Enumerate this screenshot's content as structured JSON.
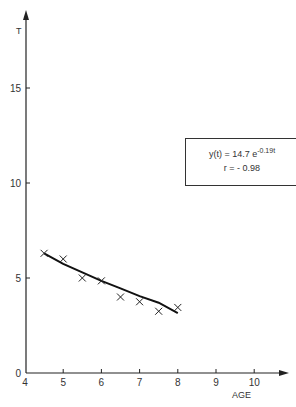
{
  "chart_data": {
    "type": "scatter",
    "title": "",
    "xlabel": "AGE",
    "ylabel": "T",
    "xlim": [
      4,
      10.8
    ],
    "ylim": [
      0,
      19
    ],
    "x_ticks": [
      "4",
      "5",
      "6",
      "7",
      "8",
      "9",
      "10"
    ],
    "y_ticks": [
      "0",
      "5",
      "10",
      "15"
    ],
    "grid": false,
    "series": [
      {
        "name": "observed",
        "marker": "x",
        "x": [
          4.5,
          5.0,
          5.5,
          6.0,
          6.5,
          7.0,
          7.5,
          8.0
        ],
        "y": [
          6.3,
          6.0,
          5.0,
          4.85,
          4.0,
          3.75,
          3.25,
          3.45
        ]
      },
      {
        "name": "fit",
        "type": "line",
        "equation": "y(t) = 14.7 e^(-0.19t)",
        "x": [
          4.5,
          5.0,
          5.5,
          6.0,
          6.5,
          7.0,
          7.5,
          8.0
        ],
        "y": [
          6.3,
          5.75,
          5.3,
          4.85,
          4.45,
          4.05,
          3.7,
          3.15
        ]
      }
    ],
    "annotations": {
      "equation_prefix": "y(t) = 14.7 e",
      "equation_exponent": "-0.19t",
      "correlation": "r = - 0.98"
    }
  }
}
